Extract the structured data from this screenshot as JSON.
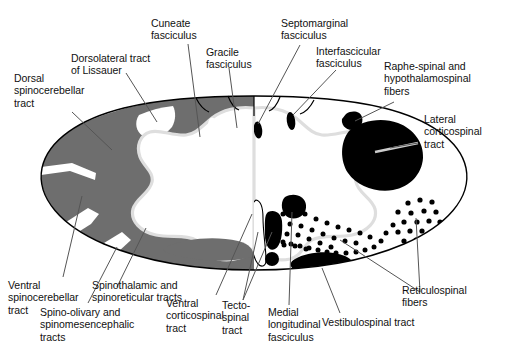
{
  "figure": {
    "type": "anatomical-cross-section",
    "background_color": "#ffffff",
    "outline_color": "#000000",
    "colors": {
      "white_matter_tract_gray": "#6e6e6e",
      "black_tract": "#000000",
      "gray_matter_white": "#ffffff",
      "gray_matter_border": "#d8d8d8",
      "leader_line": "#555555",
      "text": "#111111"
    }
  },
  "labels": {
    "dorsal_spinocerebellar_tract": "Dorsal\nspinocerebellar\ntract",
    "dorsolateral_tract_of_lissauer": "Dorsolateral tract\nof Lissauer",
    "cuneate_fasciculus": "Cuneate\nfasciculus",
    "gracile_fasciculus": "Gracile\nfasciculus",
    "septomarginal_fasciculus": "Septomarginal\nfasciculus",
    "interfascicular_fasciculus": "Interfascicular\nfasciculus",
    "raphe_spinal_and_hypothalamospinal_fibers": "Raphe-spinal and\nhypothalamospinal\nfibers",
    "lateral_corticospinal_tract": "Lateral\ncorticospinal\ntract",
    "reticulospinal_fibers": "Reticulospinal\nfibers",
    "vestibulospinal_tract": "Vestibulospinal tract",
    "medial_longitudinal_fasciculus": "Medial\nlongitudinal\nfasciculus",
    "tectospinal_tract": "Tecto-\nspinal\ntract",
    "ventral_corticospinal_tract": "Ventral\ncorticospinal\ntract",
    "spino_olivary_and_spinomesencephalic_tracts": "Spino-olivary and\nspinomesencephalic\ntracts",
    "spinothalamic_and_spinoreticular_tracts": "Spinothalamic and\nspinoreticular tracts",
    "ventral_spinocerebellar_tract": "Ventral\nspinocerebellar\ntract"
  },
  "structures": {
    "left_half_note": "ascending tracts shown in solid gray",
    "right_half_note": "descending tracts shown in black solid and stipple"
  }
}
